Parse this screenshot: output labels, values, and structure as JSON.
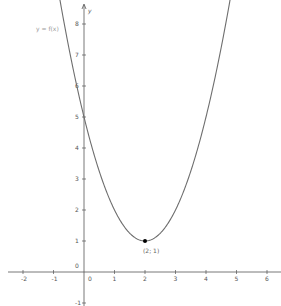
{
  "chart_data": {
    "type": "line",
    "title": "",
    "function": "f(x) = (x - 2)^2 + 1",
    "curve_label": "y = f(x)",
    "xlabel": "",
    "ylabel": "y",
    "xlim": [
      -2.6,
      6.4
    ],
    "ylim": [
      -1.1,
      8.8
    ],
    "x_ticks": [
      -2,
      -1,
      0,
      1,
      2,
      3,
      4,
      5,
      6
    ],
    "x_tick_labels": [
      "-2",
      "-1",
      "0",
      "1",
      "2",
      "3",
      "4",
      "5",
      "6"
    ],
    "y_ticks": [
      -1,
      0,
      1,
      2,
      3,
      4,
      5,
      6,
      7,
      8
    ],
    "y_tick_labels": [
      "-1",
      "0",
      "1",
      "2",
      "3",
      "4",
      "5",
      "6",
      "7",
      "8"
    ],
    "series": [
      {
        "name": "y = f(x)",
        "x": [
          -0.8,
          -0.5,
          0,
          0.5,
          1,
          1.5,
          2,
          2.5,
          3,
          3.5,
          4,
          4.5,
          4.8
        ],
        "values": [
          8.84,
          7.25,
          5,
          3.25,
          2,
          1.25,
          1,
          1.25,
          2,
          3.25,
          5,
          7.25,
          8.84
        ],
        "color": "#666666"
      }
    ],
    "points": [
      {
        "x": 2,
        "y": 1,
        "label": "(2; 1)",
        "color": "#000000"
      }
    ],
    "grid": false,
    "legend": "none"
  },
  "colors": {
    "axis": "#555555",
    "curve": "#6e6e6e",
    "point": "#000000"
  }
}
